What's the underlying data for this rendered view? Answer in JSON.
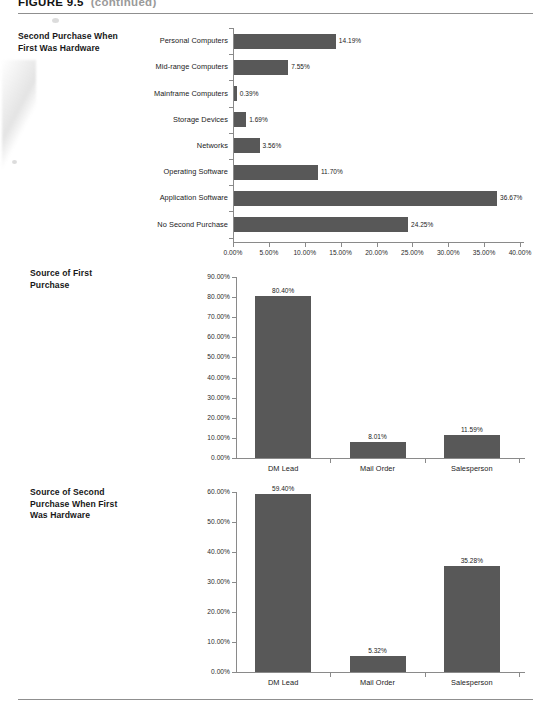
{
  "figure": {
    "number": "FIGURE 9.5",
    "title": "(continued)"
  },
  "charts": [
    {
      "id": "second-purchase-when-first-was-hardware",
      "title_lines": [
        "Second Purchase When",
        "First Was Hardware"
      ],
      "orientation": "horizontal",
      "axis": {
        "ticks": [
          "0.00%",
          "5.00%",
          "10.00%",
          "15.00%",
          "20.00%",
          "25.00%",
          "30.00%",
          "35.00%",
          "40.00%"
        ],
        "min": 0,
        "max": 40
      },
      "categories": [
        "Personal Computers",
        "Mid-range Computers",
        "Mainframe Computers",
        "Storage Devices",
        "Networks",
        "Operating Software",
        "Application Software",
        "No Second Purchase"
      ],
      "values": [
        14.19,
        7.55,
        0.39,
        1.69,
        3.56,
        11.7,
        36.67,
        24.25
      ],
      "value_labels": [
        "14.19%",
        "7.55%",
        "0.39%",
        "1.69%",
        "3.56%",
        "11.70%",
        "36.67%",
        "24.25%"
      ]
    },
    {
      "id": "source-of-first-purchase",
      "title_lines": [
        "Source of First",
        "Purchase"
      ],
      "orientation": "vertical",
      "axis": {
        "ticks": [
          "90.00%",
          "80.00%",
          "70.00%",
          "60.00%",
          "50.00%",
          "40.00%",
          "30.00%",
          "20.00%",
          "10.00%",
          "0.00%"
        ],
        "min": 0,
        "max": 90
      },
      "categories": [
        "DM Lead",
        "Mail Order",
        "Salesperson"
      ],
      "values": [
        80.4,
        8.01,
        11.59
      ],
      "value_labels": [
        "80.40%",
        "8.01%",
        "11.59%"
      ]
    },
    {
      "id": "source-of-second-purchase-when-first-was-hardware",
      "title_lines": [
        "Source of Second",
        "Purchase When First",
        "Was Hardware"
      ],
      "orientation": "vertical",
      "axis": {
        "ticks": [
          "60.00%",
          "50.00%",
          "40.00%",
          "30.00%",
          "20.00%",
          "10.00%",
          "0.00%"
        ],
        "min": 0,
        "max": 60
      },
      "categories": [
        "DM Lead",
        "Mail Order",
        "Salesperson"
      ],
      "values": [
        59.4,
        5.32,
        35.28
      ],
      "value_labels": [
        "59.40%",
        "5.32%",
        "35.28%"
      ]
    }
  ],
  "chart_data": [
    {
      "type": "bar",
      "orientation": "horizontal",
      "title": "Second Purchase When First Was Hardware",
      "categories": [
        "Personal Computers",
        "Mid-range Computers",
        "Mainframe Computers",
        "Storage Devices",
        "Networks",
        "Operating Software",
        "Application Software",
        "No Second Purchase"
      ],
      "values": [
        14.19,
        7.55,
        0.39,
        1.69,
        3.56,
        11.7,
        36.67,
        24.25
      ],
      "xlabel": "",
      "ylabel": "",
      "xlim": [
        0,
        40
      ],
      "xticks": [
        0,
        5,
        10,
        15,
        20,
        25,
        30,
        35,
        40
      ],
      "xticklabels": [
        "0.00%",
        "5.00%",
        "10.00%",
        "15.00%",
        "20.00%",
        "25.00%",
        "30.00%",
        "35.00%",
        "40.00%"
      ],
      "grid": false,
      "legend": "none",
      "data_labels": true,
      "bar_color": "#585858"
    },
    {
      "type": "bar",
      "orientation": "vertical",
      "title": "Source of First Purchase",
      "categories": [
        "DM Lead",
        "Mail Order",
        "Salesperson"
      ],
      "values": [
        80.4,
        8.01,
        11.59
      ],
      "xlabel": "",
      "ylabel": "",
      "ylim": [
        0,
        90
      ],
      "yticks": [
        0,
        10,
        20,
        30,
        40,
        50,
        60,
        70,
        80,
        90
      ],
      "yticklabels": [
        "0.00%",
        "10.00%",
        "20.00%",
        "30.00%",
        "40.00%",
        "50.00%",
        "60.00%",
        "70.00%",
        "80.00%",
        "90.00%"
      ],
      "grid": false,
      "legend": "none",
      "data_labels": true,
      "bar_color": "#585858"
    },
    {
      "type": "bar",
      "orientation": "vertical",
      "title": "Source of Second Purchase When First Was Hardware",
      "categories": [
        "DM Lead",
        "Mail Order",
        "Salesperson"
      ],
      "values": [
        59.4,
        5.32,
        35.28
      ],
      "xlabel": "",
      "ylabel": "",
      "ylim": [
        0,
        60
      ],
      "yticks": [
        0,
        10,
        20,
        30,
        40,
        50,
        60
      ],
      "yticklabels": [
        "0.00%",
        "10.00%",
        "20.00%",
        "30.00%",
        "40.00%",
        "50.00%",
        "60.00%"
      ],
      "grid": false,
      "legend": "none",
      "data_labels": true,
      "bar_color": "#585858"
    }
  ]
}
